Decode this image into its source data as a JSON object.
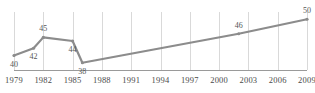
{
  "chart_data": {
    "type": "line",
    "title": "",
    "xlabel": "",
    "ylabel": "",
    "grid": true,
    "legend": false,
    "xlim": [
      1979,
      2009
    ],
    "ylim": [
      36,
      52
    ],
    "tick_labels": [
      "1979",
      "1982",
      "1985",
      "1988",
      "1991",
      "1994",
      "1997",
      "2000",
      "2003",
      "2006",
      "2009"
    ],
    "tick_values": [
      1979,
      1982,
      1985,
      1988,
      1991,
      1994,
      1997,
      2000,
      2003,
      2006,
      2009
    ],
    "series": [
      {
        "name": "series-1",
        "color": "#8c8c8c",
        "x": [
          1979,
          1981,
          1982,
          1985,
          1986,
          2002,
          2009
        ],
        "y": [
          40,
          42,
          45,
          44,
          38,
          46,
          50
        ],
        "point_labels": [
          "40",
          "42",
          "45",
          "44",
          "38",
          "46",
          "50"
        ],
        "labeled": [
          true,
          true,
          true,
          true,
          true,
          true,
          true
        ]
      }
    ],
    "annotations": [
      {
        "text": "40",
        "x": 1979,
        "y": 40,
        "position": "below"
      },
      {
        "text": "42",
        "x": 1981,
        "y": 42,
        "position": "below"
      },
      {
        "text": "45",
        "x": 1982,
        "y": 45,
        "position": "above"
      },
      {
        "text": "44",
        "x": 1985,
        "y": 44,
        "position": "below"
      },
      {
        "text": "38",
        "x": 1986,
        "y": 38,
        "position": "below"
      },
      {
        "text": "46",
        "x": 2002,
        "y": 46,
        "position": "above"
      },
      {
        "text": "50",
        "x": 2009,
        "y": 50,
        "position": "above"
      }
    ]
  },
  "colors": {
    "line": "#8c8c8c",
    "grid": "#d9d9d9",
    "axis": "#9a9a9a",
    "text": "#4a4a4a"
  }
}
